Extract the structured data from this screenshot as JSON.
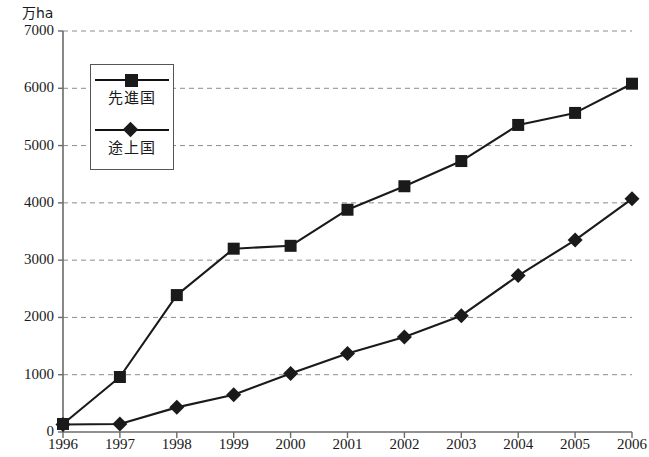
{
  "chart_data": {
    "type": "line",
    "title": "",
    "subtitle": "",
    "xlabel": "",
    "ylabel": "万ha",
    "unit_label": "万ha",
    "categories": [
      "1996",
      "1997",
      "1998",
      "1999",
      "2000",
      "2001",
      "2002",
      "2003",
      "2004",
      "2005",
      "2006"
    ],
    "x": [
      1996,
      1997,
      1998,
      1999,
      2000,
      2001,
      2002,
      2003,
      2004,
      2005,
      2006
    ],
    "xlim": [
      1996,
      2006
    ],
    "ylim": [
      0,
      7000
    ],
    "yticks": [
      0,
      1000,
      2000,
      3000,
      4000,
      5000,
      6000,
      7000
    ],
    "ytick_labels": [
      "0",
      "1000",
      "2000",
      "3000",
      "4000",
      "5000",
      "6000",
      "7000"
    ],
    "grid": true,
    "grid_style": "dashed-horizontal",
    "legend_position": "upper-left-inset",
    "series": [
      {
        "name": "先進国",
        "marker": "square",
        "color": "#1a1a1a",
        "values": [
          140,
          960,
          2390,
          3200,
          3250,
          3880,
          4290,
          4730,
          5360,
          5570,
          6080
        ]
      },
      {
        "name": "途上国",
        "marker": "diamond",
        "color": "#1a1a1a",
        "values": [
          130,
          140,
          430,
          650,
          1020,
          1370,
          1660,
          2030,
          2730,
          3350,
          4070
        ]
      }
    ]
  },
  "legend": {
    "items": [
      {
        "label": "先進国",
        "marker": "square"
      },
      {
        "label": "途上国",
        "marker": "diamond"
      }
    ]
  },
  "colors": {
    "ink": "#1a1a1a",
    "axis": "#6b6b6b",
    "grid": "#8c8c8c",
    "background": "#ffffff"
  }
}
